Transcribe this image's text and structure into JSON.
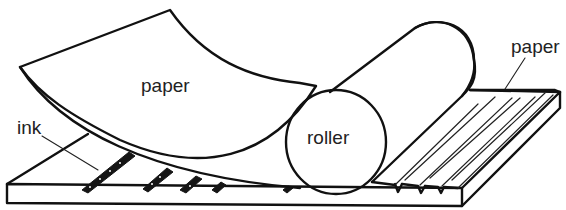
{
  "diagram": {
    "labels": {
      "paper_top": "paper",
      "ink": "ink",
      "roller": "roller",
      "paper_right": "paper"
    },
    "colors": {
      "line": "#111111",
      "text": "#222222",
      "background": "#ffffff"
    }
  }
}
